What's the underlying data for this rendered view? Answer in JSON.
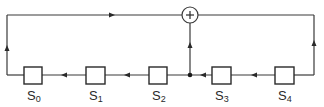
{
  "diagram": {
    "type": "linear-feedback-shift-register",
    "stages": [
      {
        "id": "s0",
        "label": "S",
        "subscript": "0"
      },
      {
        "id": "s1",
        "label": "S",
        "subscript": "1"
      },
      {
        "id": "s2",
        "label": "S",
        "subscript": "2"
      },
      {
        "id": "s3",
        "label": "S",
        "subscript": "3"
      },
      {
        "id": "s4",
        "label": "S",
        "subscript": "4"
      }
    ],
    "adder": {
      "symbol": "+"
    },
    "shift_direction": "right-to-left",
    "feedback_taps": [
      "s4",
      "s2-s3 junction"
    ],
    "feedback_destination": "s0 output to left loop into adder line"
  },
  "colors": {
    "line": "#3a3a3a",
    "box_stroke": "#2a2a2a",
    "background": "#ffffff"
  }
}
